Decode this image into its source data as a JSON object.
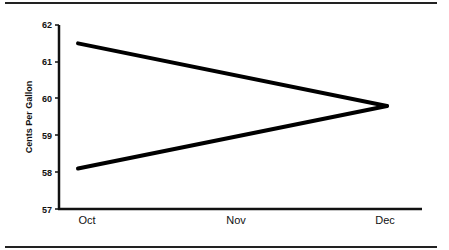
{
  "chart_data": {
    "type": "line",
    "title": "",
    "xlabel": "",
    "ylabel": "Cents Per Gallon",
    "categories": [
      "Oct",
      "Nov",
      "Dec"
    ],
    "x": [
      "Oct",
      "Dec"
    ],
    "series": [
      {
        "name": "Upper line",
        "values": [
          61.5,
          59.8
        ],
        "x": [
          "Oct",
          "Dec"
        ]
      },
      {
        "name": "Lower line",
        "values": [
          58.1,
          59.8
        ],
        "x": [
          "Oct",
          "Dec"
        ]
      }
    ],
    "yticks": [
      "57",
      "58",
      "59",
      "60",
      "61",
      "62"
    ],
    "ylim": [
      57,
      62
    ],
    "grid": false,
    "legend": "none",
    "line_color": "#000000"
  }
}
